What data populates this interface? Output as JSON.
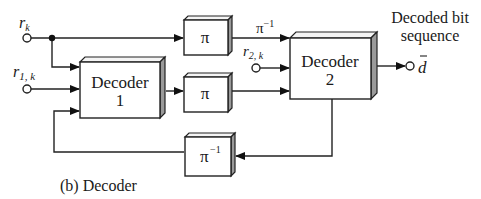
{
  "diagram": {
    "caption": "(b) Decoder",
    "inputs": {
      "rk": {
        "base": "r",
        "sub": "k"
      },
      "r1k": {
        "base": "r",
        "sub": "1, k"
      },
      "r2k": {
        "base": "r",
        "sub": "2, k"
      }
    },
    "blocks": {
      "decoder1": {
        "line1": "Decoder",
        "line2": "1"
      },
      "decoder2": {
        "line1": "Decoder",
        "line2": "2"
      },
      "interleaver_top": {
        "label": "π"
      },
      "interleaver_mid": {
        "label": "π"
      },
      "deinterleaver_bottom": {
        "base": "π",
        "sup": "−1"
      }
    },
    "edge_labels": {
      "pi_inverse_top": {
        "base": "π",
        "sup": "−1"
      }
    },
    "output": {
      "title_line1": "Decoded bit",
      "title_line2": "sequence",
      "symbol": "d"
    }
  }
}
